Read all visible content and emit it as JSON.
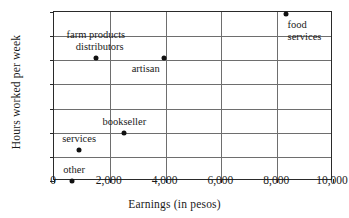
{
  "chart_data": {
    "type": "scatter",
    "title": "",
    "xlabel": "Earnings (in pesos)",
    "ylabel": "Hours worked per week",
    "xlim": [
      0,
      10000
    ],
    "ylim": [
      56.0,
      72.0
    ],
    "grid": true,
    "legend": "none",
    "xticks": [
      {
        "value": 0,
        "label": "0"
      },
      {
        "value": 2000,
        "label": "2,000"
      },
      {
        "value": 4000,
        "label": "4,000"
      },
      {
        "value": 6000,
        "label": "6,000"
      },
      {
        "value": 8000,
        "label": "8,000"
      },
      {
        "value": 10000,
        "label": "10,000"
      }
    ],
    "yticks": [
      {
        "label": "72.0"
      },
      {
        "label": "70.0"
      },
      {
        "label": "68.0"
      },
      {
        "label": "66.0"
      },
      {
        "label": "64.0"
      },
      {
        "label": "62.0"
      },
      {
        "label": "58.0"
      },
      {
        "label": "56.0"
      }
    ],
    "points": [
      {
        "name": "food services",
        "label": "food\nservices",
        "x": 8300,
        "y": 71.8,
        "label_align": "left",
        "label_dx": 2,
        "label_dy": 5
      },
      {
        "name": "farm products distributors",
        "label": "farm products\n   distributors",
        "x": 1500,
        "y": 68.15,
        "label_align": "center",
        "label_dx": 0,
        "label_dy": -29
      },
      {
        "name": "artisan",
        "label": "artisan",
        "x": 3930,
        "y": 68.15,
        "label_align": "center",
        "label_dx": -18,
        "label_dy": 5
      },
      {
        "name": "bookseller",
        "label": "bookseller",
        "x": 2520,
        "y": 61.9,
        "label_align": "center",
        "label_dx": 0,
        "label_dy": -17
      },
      {
        "name": "services",
        "label": "services",
        "x": 900,
        "y": 59.1,
        "label_align": "center",
        "label_dx": 0,
        "label_dy": -17
      },
      {
        "name": "other",
        "label": "other",
        "x": 650,
        "y": 56.0,
        "label_align": "center",
        "label_dx": 2,
        "label_dy": -17
      }
    ]
  }
}
